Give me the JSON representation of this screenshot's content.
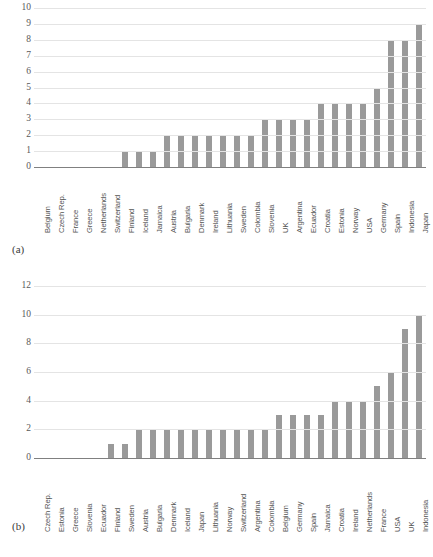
{
  "figure": {
    "panel_a_label": "(a)",
    "panel_b_label": "(b)",
    "bar_color": "#9a9a9a",
    "gridline_color": "#e4e4e4",
    "axis_color": "#808080"
  },
  "chart_data": [
    {
      "type": "bar",
      "id": "a",
      "panel": "(a)",
      "title": "",
      "xlabel": "",
      "ylabel": "",
      "ylim": [
        0,
        10
      ],
      "yticks": [
        0,
        1,
        2,
        3,
        4,
        5,
        6,
        7,
        8,
        9,
        10
      ],
      "ytick_labels": [
        "0",
        "1",
        "2",
        "3",
        "4",
        "5",
        "6",
        "7",
        "8",
        "9",
        "10"
      ],
      "grid": true,
      "legend": false,
      "categories": [
        "Belgium",
        "Czech Rep.",
        "France",
        "Greece",
        "Netherlands",
        "Switzerland",
        "Finland",
        "Iceland",
        "Jamaica",
        "Austria",
        "Bulgaria",
        "Denmark",
        "Ireland",
        "Lithuania",
        "Sweden",
        "Colombia",
        "Slovenia",
        "UK",
        "Argentina",
        "Ecuador",
        "Croatia",
        "Estonia",
        "Norway",
        "USA",
        "Germany",
        "Spain",
        "Indonesia",
        "Japan"
      ],
      "values": [
        0,
        0,
        0,
        0,
        0,
        0,
        1,
        1,
        1,
        2,
        2,
        2,
        2,
        2,
        2,
        2,
        3,
        3,
        3,
        3,
        4,
        4,
        4,
        4,
        5,
        8,
        8,
        9
      ]
    },
    {
      "type": "bar",
      "id": "b",
      "panel": "(b)",
      "title": "",
      "xlabel": "",
      "ylabel": "",
      "ylim": [
        0,
        12
      ],
      "yticks": [
        0,
        2,
        4,
        6,
        8,
        10,
        12
      ],
      "ytick_labels": [
        "0",
        "2",
        "4",
        "6",
        "8",
        "10",
        "12"
      ],
      "grid": true,
      "legend": false,
      "categories": [
        "Czech Rep.",
        "Estonia",
        "Greece",
        "Slovenia",
        "Ecuador",
        "Finland",
        "Sweden",
        "Austria",
        "Bulgaria",
        "Denmark",
        "Iceland",
        "Japan",
        "Lithuania",
        "Norway",
        "Switzerland",
        "Argentina",
        "Colombia",
        "Belgium",
        "Germany",
        "Spain",
        "Jamaica",
        "Croatia",
        "Ireland",
        "Netherlands",
        "France",
        "USA",
        "UK",
        "Indonesia"
      ],
      "values": [
        0,
        0,
        0,
        0,
        0,
        1,
        1,
        2,
        2,
        2,
        2,
        2,
        2,
        2,
        2,
        2,
        2,
        3,
        3,
        3,
        3,
        4,
        4,
        4,
        5,
        6,
        9,
        10
      ]
    }
  ]
}
